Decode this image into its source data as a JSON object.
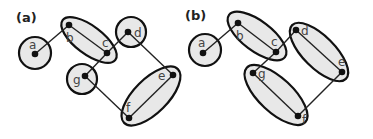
{
  "panels": [
    {
      "label": "(a)",
      "nodes": [
        {
          "id": "a",
          "label": "a",
          "x": 35,
          "y": 54
        },
        {
          "id": "b",
          "label": "b",
          "x": 69,
          "y": 25
        },
        {
          "id": "c",
          "label": "c",
          "x": 107,
          "y": 53
        },
        {
          "id": "d",
          "label": "d",
          "x": 128,
          "y": 32
        },
        {
          "id": "e",
          "label": "e",
          "x": 173,
          "y": 75
        },
        {
          "id": "f",
          "label": "f",
          "x": 129,
          "y": 118
        },
        {
          "id": "g",
          "label": "g",
          "x": 85,
          "y": 76
        }
      ],
      "edges": [
        [
          "a",
          "b"
        ],
        [
          "b",
          "c"
        ],
        [
          "c",
          "g"
        ],
        [
          "c",
          "d"
        ],
        [
          "d",
          "e"
        ],
        [
          "e",
          "f"
        ],
        [
          "g",
          "f"
        ]
      ],
      "groups": [
        [
          "a"
        ],
        [
          "b",
          "c"
        ],
        [
          "d"
        ],
        [
          "g"
        ],
        [
          "e",
          "f"
        ]
      ]
    },
    {
      "label": "(b)",
      "nodes": [
        {
          "id": "a",
          "label": "a",
          "x": 203,
          "y": 53
        },
        {
          "id": "b",
          "label": "b",
          "x": 238,
          "y": 23
        },
        {
          "id": "c",
          "label": "c",
          "x": 276,
          "y": 52
        },
        {
          "id": "d",
          "label": "d",
          "x": 296,
          "y": 30
        },
        {
          "id": "e",
          "label": "e",
          "x": 342,
          "y": 72
        },
        {
          "id": "f",
          "label": "f",
          "x": 298,
          "y": 116
        },
        {
          "id": "g",
          "label": "g",
          "x": 253,
          "y": 73
        }
      ],
      "edges": [
        [
          "a",
          "b"
        ],
        [
          "b",
          "c"
        ],
        [
          "c",
          "g"
        ],
        [
          "c",
          "d"
        ],
        [
          "d",
          "e"
        ],
        [
          "e",
          "f"
        ],
        [
          "g",
          "f"
        ]
      ],
      "groups": [
        [
          "a"
        ],
        [
          "b",
          "c"
        ],
        [
          "d",
          "e"
        ],
        [
          "g",
          "f"
        ]
      ]
    }
  ]
}
